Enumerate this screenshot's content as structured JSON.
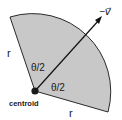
{
  "diagram": {
    "type": "circular-sector",
    "fill_color": "#c8c8c8",
    "edge_color": "#2a2a2a",
    "labels": {
      "radius_left": "r",
      "radius_bottom": "r",
      "half_angle_upper": "θ/2",
      "half_angle_lower": "θ/2",
      "vertex": "centroid",
      "arrow": "−v⃗"
    }
  }
}
